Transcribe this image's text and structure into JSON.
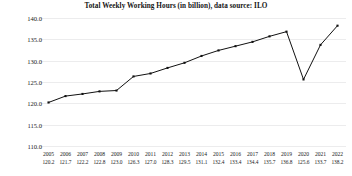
{
  "chart_data": {
    "type": "line",
    "title": "Total Weekly Working Hours (in billion), data source: ILO",
    "xlabel": "",
    "ylabel": "",
    "categories": [
      "2005",
      "2006",
      "2007",
      "2008",
      "2009",
      "2010",
      "2011",
      "2012",
      "2013",
      "2014",
      "2015",
      "2016",
      "2017",
      "2018",
      "2019",
      "2020",
      "2021",
      "2022"
    ],
    "values": [
      120.2,
      121.7,
      122.2,
      122.8,
      123.0,
      126.3,
      127.0,
      128.3,
      129.5,
      131.1,
      132.4,
      133.4,
      134.4,
      135.7,
      136.8,
      125.6,
      133.7,
      138.2
    ],
    "value_labels": [
      "120.2",
      "121.7",
      "122.2",
      "122.8",
      "123.0",
      "126.3",
      "127.0",
      "128.3",
      "129.5",
      "131.1",
      "132.4",
      "133.4",
      "134.4",
      "135.7",
      "136.8",
      "125.6",
      "133.7",
      "138.2"
    ],
    "ylim": [
      110.0,
      140.0
    ],
    "ytick_labels": [
      "140.0",
      "135.0",
      "130.0",
      "125.0",
      "120.0",
      "115.0",
      "110.0"
    ],
    "yticks": [
      140.0,
      135.0,
      130.0,
      125.0,
      120.0,
      115.0,
      110.0
    ],
    "grid": true,
    "legend": false,
    "line_color": "#111111",
    "marker": "square",
    "marker_color": "#111111",
    "grid_color": "#ececed",
    "background_color": "#ffffff"
  }
}
